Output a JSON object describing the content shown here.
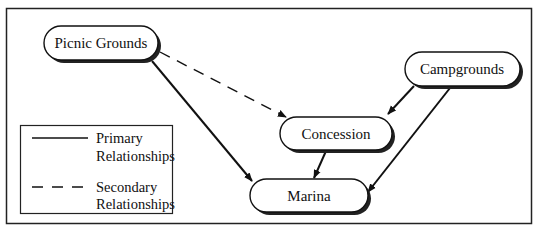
{
  "diagram": {
    "type": "relationship-diagram",
    "nodes": [
      {
        "id": "picnic",
        "label": "Picnic Grounds",
        "x": 44,
        "y": 26,
        "w": 114,
        "h": 34
      },
      {
        "id": "campgrounds",
        "label": "Campgrounds",
        "x": 405,
        "y": 52,
        "w": 115,
        "h": 34
      },
      {
        "id": "concession",
        "label": "Concession",
        "x": 280,
        "y": 117,
        "w": 112,
        "h": 33
      },
      {
        "id": "marina",
        "label": "Marina",
        "x": 250,
        "y": 179,
        "w": 118,
        "h": 33
      }
    ],
    "edges": [
      {
        "from": "Picnic Grounds",
        "to": "Concession",
        "type": "secondary"
      },
      {
        "from": "Picnic Grounds",
        "to": "Marina",
        "type": "primary"
      },
      {
        "from": "Campgrounds",
        "to": "Concession",
        "type": "primary"
      },
      {
        "from": "Campgrounds",
        "to": "Marina",
        "type": "primary"
      },
      {
        "from": "Concession",
        "to": "Marina",
        "type": "primary"
      }
    ],
    "legend": {
      "primary": {
        "line1": "Primary",
        "line2": "Relationships",
        "style": "solid"
      },
      "secondary": {
        "line1": "Secondary",
        "line2": "Relationships",
        "style": "dashed"
      }
    },
    "colors": {
      "stroke": "#111111",
      "shadow": "#222222",
      "background": "#ffffff"
    }
  }
}
